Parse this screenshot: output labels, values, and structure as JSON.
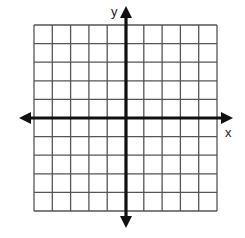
{
  "diagram": {
    "type": "coordinate-plane",
    "grid": {
      "columns": 10,
      "rows": 10,
      "left": 34,
      "top": 25,
      "right": 217,
      "bottom": 211,
      "line_color": "#555555"
    },
    "axes": {
      "x_label": "x",
      "y_label": "y",
      "origin_col": 5,
      "origin_row": 5,
      "axis_color": "#111111",
      "x_axis": {
        "start": 19,
        "end": 233,
        "y": 118
      },
      "y_axis": {
        "x": 126,
        "start": 6,
        "end": 228
      }
    }
  }
}
